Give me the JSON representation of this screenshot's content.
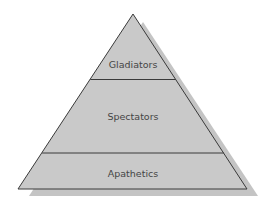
{
  "diagram": {
    "type": "pyramid",
    "colors": {
      "fill": "#c9c9c9",
      "shadow": "#c2c2c2",
      "outline": "#3a3a3a",
      "label": "#454545",
      "background": "#ffffff"
    },
    "tiers": [
      {
        "label": "Gladiators",
        "position": "top"
      },
      {
        "label": "Spectators",
        "position": "middle"
      },
      {
        "label": "Apathetics",
        "position": "bottom"
      }
    ]
  }
}
